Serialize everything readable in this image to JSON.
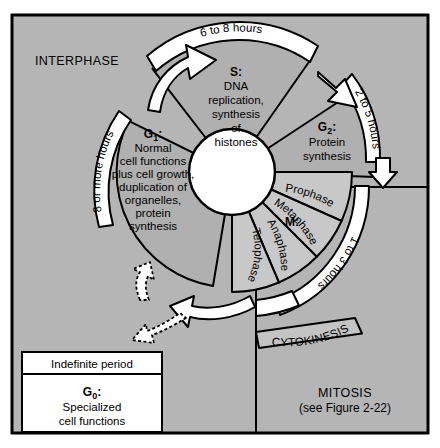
{
  "figure": {
    "title_interphase": "INTERPHASE",
    "title_mitosis": "MITOSIS",
    "mitosis_reference": "(see Figure 2-22)"
  },
  "colors": {
    "background": "#b3b3b3",
    "panel": "#b8b8b8",
    "sector_interphase": "#b0b0b0",
    "sector_mitosis": "#c8c8c8",
    "band_white": "#ffffff",
    "band_cytokinesis": "#c4c4c4",
    "outline": "#000000",
    "center_circle": "#ffffff",
    "box_fill": "#ffffff"
  },
  "phases": {
    "g1": {
      "name": "G",
      "subscript": "1",
      "colon": ":",
      "lines": [
        "Normal",
        "cell functions",
        "plus cell growth,",
        "duplication of",
        "organelles,",
        "protein",
        "synthesis"
      ],
      "duration": "8 or more hours"
    },
    "s": {
      "name": "S",
      "subscript": "",
      "colon": ":",
      "lines": [
        "DNA",
        "replication,",
        "synthesis",
        "of",
        "histones"
      ],
      "duration": "6 to 8 hours"
    },
    "g2": {
      "name": "G",
      "subscript": "2",
      "colon": ":",
      "lines": [
        "Protein",
        "synthesis"
      ],
      "duration": "2 to 5 hours"
    },
    "m": {
      "name": "M",
      "subscript": "",
      "colon": ":",
      "duration": "1 to 3 hours",
      "stages": [
        "Prophase",
        "Metaphase",
        "Anaphase",
        "Telophase"
      ]
    },
    "cytokinesis": {
      "label": "CYTOKINESIS"
    },
    "g0": {
      "header": "Indefinite period",
      "name": "G",
      "subscript": "0",
      "colon": ":",
      "lines": [
        "Specialized",
        "cell functions"
      ]
    }
  },
  "arrows": {
    "g1_to_s": "arrow-g1-to-s",
    "s_to_g2": "arrow-s-to-g2",
    "g2_to_m": "arrow-g2-to-m",
    "cytokinesis_to_g1": "arrow-cytokinesis-to-g1",
    "g1_to_g0": "arrow-g1-to-g0-dashed",
    "g0_to_g1": "arrow-g0-to-g1-dashed"
  }
}
